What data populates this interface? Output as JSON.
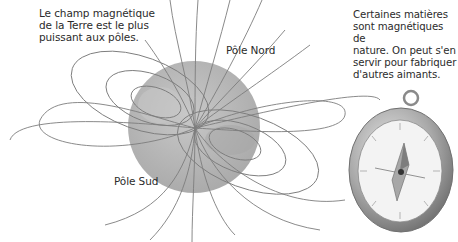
{
  "captions": {
    "earth_field": [
      "Le champ magnétique",
      "de la Terre est le plus",
      "puissant aux pôles."
    ],
    "magnets": [
      "Certaines matières",
      "sont magnétiques de",
      "nature. On peut s'en",
      "servir pour fabriquer",
      "d'autres aimants."
    ]
  },
  "labels": {
    "north_pole": "Pôle Nord",
    "south_pole": "Pôle Sud"
  },
  "colors": {
    "globe": "#b9b9b9",
    "field_lines": "#7a7a7a",
    "compass_rim": "#9a9a9a",
    "compass_face": "#f2f2f2"
  },
  "illustrations": {
    "earth": "earth-globe-with-magnetic-field-lines",
    "compass": "compass-icon"
  }
}
